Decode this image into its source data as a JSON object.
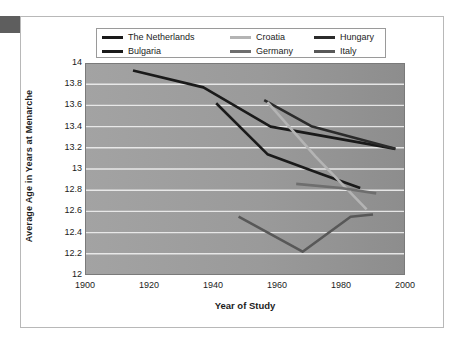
{
  "chart_data": {
    "type": "line",
    "title": "",
    "xlabel": "Year of Study",
    "ylabel": "Average Age in Years at Menarche",
    "xlim": [
      1900,
      2000
    ],
    "ylim": [
      12,
      14
    ],
    "xticks": [
      1900,
      1920,
      1940,
      1960,
      1980,
      2000
    ],
    "yticks": [
      12,
      12.2,
      12.4,
      12.6,
      12.8,
      13,
      13.2,
      13.4,
      13.6,
      13.8,
      14
    ],
    "xtick_labels": [
      "1900",
      "1920",
      "1940",
      "1960",
      "1980",
      "2000"
    ],
    "ytick_labels": [
      "12",
      "12.2",
      "12.4",
      "12.6",
      "12.8",
      "13",
      "13.2",
      "13.4",
      "13.6",
      "13.8",
      "14"
    ],
    "grid": "horizontal",
    "plot_background": "#9a9a9a",
    "gridline_color": "#f0f0f0",
    "legend_position": "top",
    "series": [
      {
        "name": "The Netherlands",
        "color": "#1a1a1a",
        "x": [
          1915,
          1937,
          1958,
          1997
        ],
        "y": [
          13.93,
          13.77,
          13.4,
          13.19
        ]
      },
      {
        "name": "Bulgaria",
        "color": "#1a1a1a",
        "x": [
          1941,
          1957,
          1974,
          1986
        ],
        "y": [
          13.62,
          13.14,
          12.95,
          12.82
        ]
      },
      {
        "name": "Hungary",
        "color": "#2b2b2b",
        "x": [
          1956,
          1971,
          1997
        ],
        "y": [
          13.65,
          13.4,
          13.19
        ]
      },
      {
        "name": "Croatia",
        "color": "#b4b4b4",
        "x": [
          1957,
          1972,
          1988
        ],
        "y": [
          13.63,
          13.12,
          12.62
        ]
      },
      {
        "name": "Germany",
        "color": "#6e6e6e",
        "x": [
          1966,
          1980,
          1991
        ],
        "y": [
          12.86,
          12.82,
          12.77
        ]
      },
      {
        "name": "Italy",
        "color": "#585858",
        "x": [
          1948,
          1968,
          1983,
          1990
        ],
        "y": [
          12.55,
          12.22,
          12.55,
          12.57
        ]
      }
    ]
  },
  "legend": {
    "entries": [
      {
        "label": "The Netherlands",
        "color": "#1a1a1a"
      },
      {
        "label": "Croatia",
        "color": "#b4b4b4"
      },
      {
        "label": "Hungary",
        "color": "#2b2b2b"
      },
      {
        "label": "Bulgaria",
        "color": "#1a1a1a"
      },
      {
        "label": "Germany",
        "color": "#6e6e6e"
      },
      {
        "label": "Italy",
        "color": "#585858"
      }
    ]
  }
}
